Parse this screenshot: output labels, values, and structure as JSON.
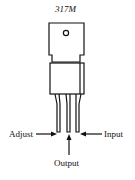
{
  "title": "317M",
  "labels": {
    "adjust": "Adjust",
    "output": "Output",
    "input": "Input"
  },
  "colors": {
    "line": "#111111",
    "background": "#ffffff"
  }
}
